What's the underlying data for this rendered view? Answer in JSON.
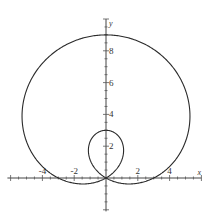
{
  "chart_data": {
    "type": "line",
    "title": "",
    "equation": "r = 3 + 6 sin(theta)",
    "xlabel": "x",
    "ylabel": "y",
    "xlim": [
      -6.2,
      6.0
    ],
    "ylim": [
      -2.1,
      10.0
    ],
    "x_tick_labels": [
      {
        "value": -4,
        "label": "-4"
      },
      {
        "value": -2,
        "label": "-2"
      },
      {
        "value": 2,
        "label": "2"
      },
      {
        "value": 4,
        "label": "4"
      }
    ],
    "y_tick_labels": [
      {
        "value": 2,
        "label": "2"
      },
      {
        "value": 4,
        "label": "4"
      },
      {
        "value": 6,
        "label": "6"
      },
      {
        "value": 8,
        "label": "8"
      }
    ],
    "minor_tick_step": 0.5,
    "grid": false,
    "series": [
      {
        "name": "limacon",
        "a": 3,
        "b": 6,
        "color": "#2a2a2a"
      }
    ]
  }
}
